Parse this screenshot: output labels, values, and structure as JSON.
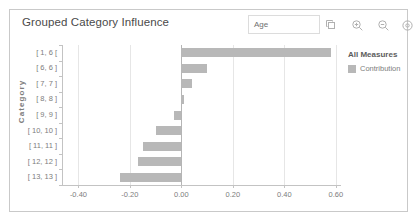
{
  "panel": {
    "title": "Grouped Category Influence"
  },
  "toolbar": {
    "dimension_value": "Age",
    "icons": [
      {
        "name": "duplicate-icon",
        "label": "Duplicate"
      },
      {
        "name": "zoom-in-icon",
        "label": "Zoom In"
      },
      {
        "name": "zoom-out-icon",
        "label": "Zoom Out"
      },
      {
        "name": "settings-icon",
        "label": "Settings"
      }
    ]
  },
  "legend": {
    "title": "All Measures",
    "entries": [
      {
        "label": "Contribution",
        "color": "#b8b8b8"
      }
    ]
  },
  "chart_data": {
    "type": "bar",
    "orientation": "horizontal",
    "title": "Grouped Category Influence",
    "xlabel": "",
    "ylabel": "Category",
    "categories": [
      "[ 1, 6 [",
      "[ 6, 6 ]",
      "[ 7, 7 ]",
      "[ 8, 8 ]",
      "[ 9, 9 ]",
      "[ 10, 10 ]",
      "[ 11, 11 ]",
      "[ 12, 12 ]",
      "[ 13, 13 ]"
    ],
    "series": [
      {
        "name": "Contribution",
        "color": "#b8b8b8",
        "values": [
          0.58,
          0.1,
          0.04,
          0.012,
          -0.03,
          -0.1,
          -0.15,
          -0.17,
          -0.24
        ]
      }
    ],
    "xlim": [
      -0.46,
      0.62
    ],
    "xticks": [
      -0.4,
      -0.2,
      0.0,
      0.2,
      0.4,
      0.6
    ],
    "xticklabels": [
      "-0.40",
      "-0.20",
      "0.00",
      "0.20",
      "0.40",
      "0.60"
    ],
    "grid": true,
    "gridlines_at": [
      -0.4,
      -0.2,
      0.2,
      0.4,
      0.6
    ],
    "zero_line": 0.0,
    "legend_position": "right"
  }
}
